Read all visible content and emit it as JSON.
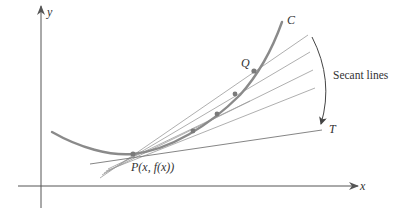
{
  "figure": {
    "labels": {
      "y_axis": "y",
      "x_axis": "x",
      "curve": "C",
      "point_q": "Q",
      "point_p": "P(x, f(x))",
      "tangent": "T",
      "secant_lines": "Secant lines"
    },
    "colors": {
      "curve": "#8a8a8a",
      "axes": "#555555",
      "secants": "#9a9a9a",
      "points": "#7a7a7a",
      "text": "#333333"
    }
  }
}
